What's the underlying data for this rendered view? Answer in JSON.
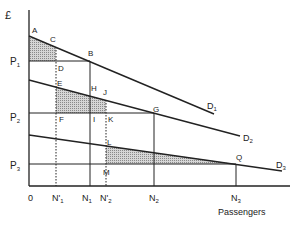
{
  "diagram": {
    "y_axis_label": "£",
    "x_axis_label": "Passengers",
    "origin_label": "0",
    "price_levels": [
      {
        "label": "P",
        "sub": "1",
        "y": 61
      },
      {
        "label": "P",
        "sub": "2",
        "y": 113
      },
      {
        "label": "P",
        "sub": "3",
        "y": 164
      }
    ],
    "quantity_ticks": [
      {
        "label": "N'",
        "sub": "1",
        "x": 56
      },
      {
        "label": "N",
        "sub": "1",
        "x": 90
      },
      {
        "label": "N'",
        "sub": "2",
        "x": 106
      },
      {
        "label": "N",
        "sub": "2",
        "x": 154
      },
      {
        "label": "N",
        "sub": "3",
        "x": 236
      }
    ],
    "demand_curves": [
      {
        "label": "D",
        "sub": "1",
        "x1": 29,
        "y1": 36,
        "x2": 214,
        "y2": 113
      },
      {
        "label": "D",
        "sub": "2",
        "x1": 29,
        "y1": 80,
        "x2": 240,
        "y2": 136
      },
      {
        "label": "D",
        "sub": "3",
        "x1": 29,
        "y1": 135,
        "x2": 282,
        "y2": 171
      }
    ],
    "points": {
      "A": "A",
      "B": "B",
      "C": "C",
      "D": "D",
      "E": "E",
      "F": "F",
      "G": "G",
      "H": "H",
      "I": "I",
      "J": "J",
      "K": "K",
      "L": "L",
      "M": "M",
      "Q": "Q"
    },
    "colors": {
      "line": "#222222",
      "shade": "#bdbdbd"
    }
  }
}
